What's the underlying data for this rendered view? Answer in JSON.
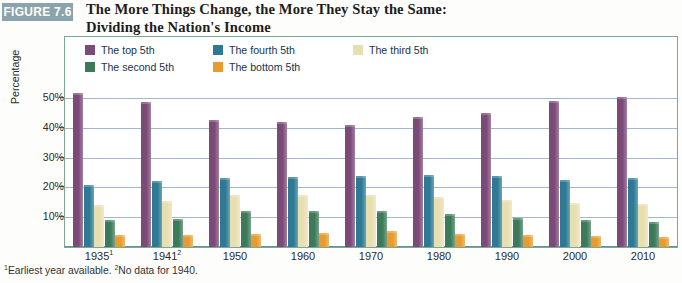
{
  "header": {
    "badge": "FIGURE 7.6",
    "title_line1": "The More Things Change, the More They Stay the Same:",
    "title_line2": "Dividing the Nation's Income"
  },
  "footnote": {
    "mark1": "1",
    "text1": "Earliest year available.",
    "mark2": "2",
    "text2": "No data for 1940."
  },
  "legend": {
    "items": [
      {
        "label": "The top 5th",
        "color": "#7B4A78"
      },
      {
        "label": "The second 5th",
        "color": "#3D7A5A"
      },
      {
        "label": "The fourth 5th",
        "color": "#2E7A95"
      },
      {
        "label": "The bottom 5th",
        "color": "#E89B2E"
      },
      {
        "label": "The third 5th",
        "color": "#E8DFB0"
      }
    ]
  },
  "chart_data": {
    "type": "bar",
    "title": "The More Things Change, the More They Stay the Same: Dividing the Nation's Income",
    "xlabel": "",
    "ylabel": "Percentage",
    "ylim": [
      0,
      55
    ],
    "yticks": [
      10,
      20,
      30,
      40,
      50
    ],
    "ytick_labels": [
      "10%",
      "20%",
      "30%",
      "40%",
      "50%"
    ],
    "grid": true,
    "legend_position": "top-inside",
    "categories": [
      "1935",
      "1941",
      "1950",
      "1960",
      "1970",
      "1980",
      "1990",
      "2000",
      "2010"
    ],
    "category_labels": [
      "1935¹",
      "1941²",
      "1950",
      "1960",
      "1970",
      "1980",
      "1990",
      "2000",
      "2010"
    ],
    "series": [
      {
        "name": "The top 5th",
        "color": "#7B4A78",
        "values": [
          51.7,
          48.8,
          42.7,
          42.0,
          40.9,
          43.7,
          45.0,
          49.0,
          50.2
        ]
      },
      {
        "name": "The fourth 5th",
        "color": "#2E7A95",
        "values": [
          20.9,
          22.3,
          23.1,
          23.6,
          23.8,
          24.0,
          23.7,
          22.6,
          23.0
        ]
      },
      {
        "name": "The third 5th",
        "color": "#E8DFB0",
        "values": [
          14.1,
          15.3,
          17.4,
          17.6,
          17.6,
          16.8,
          15.9,
          14.7,
          14.3
        ]
      },
      {
        "name": "The second 5th",
        "color": "#3D7A5A",
        "values": [
          9.2,
          9.5,
          12.0,
          12.2,
          12.2,
          11.1,
          9.7,
          9.0,
          8.3
        ]
      },
      {
        "name": "The bottom 5th",
        "color": "#E89B2E",
        "values": [
          4.1,
          4.1,
          4.5,
          4.8,
          5.4,
          4.2,
          3.9,
          3.6,
          3.3
        ]
      }
    ]
  }
}
